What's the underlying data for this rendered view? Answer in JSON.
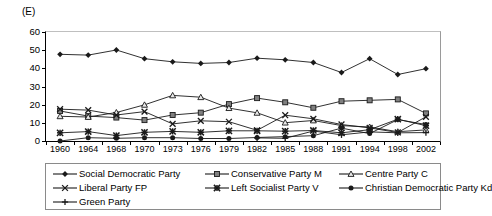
{
  "axis_unit_label": "(E)",
  "chart_data": {
    "type": "line",
    "title": "",
    "subtitle": "",
    "xlabel": "",
    "ylabel": "(E)",
    "ylim": [
      0,
      60
    ],
    "yticks": [
      0,
      10,
      20,
      30,
      40,
      50,
      60
    ],
    "grid": false,
    "legend_position": "bottom",
    "categories": [
      "1960",
      "1964",
      "1968",
      "1970",
      "1973",
      "1976",
      "1979",
      "1982",
      "1985",
      "1988",
      "1991",
      "1994",
      "1998",
      "2002"
    ],
    "series": [
      {
        "name": "Social Democratic Party",
        "marker": "diamond",
        "values": [
          47.7,
          47.3,
          50.1,
          45.3,
          43.6,
          42.7,
          43.2,
          45.6,
          44.7,
          43.2,
          37.7,
          45.3,
          36.6,
          39.8
        ]
      },
      {
        "name": "Conservative Party M",
        "marker": "square",
        "values": [
          16.5,
          13.7,
          12.9,
          11.5,
          14.3,
          15.6,
          20.3,
          23.6,
          21.3,
          18.3,
          21.9,
          22.4,
          22.9,
          15.2
        ]
      },
      {
        "name": "Centre Party C",
        "marker": "triangle",
        "values": [
          13.6,
          13.2,
          15.7,
          19.9,
          25.1,
          24.1,
          18.1,
          15.5,
          10.1,
          11.3,
          8.5,
          7.7,
          5.1,
          6.1
        ]
      },
      {
        "name": "Liberal Party FP",
        "marker": "cross-x",
        "values": [
          17.5,
          17.0,
          14.3,
          16.2,
          9.4,
          11.1,
          10.6,
          5.9,
          14.2,
          12.2,
          9.1,
          7.2,
          4.7,
          13.3
        ]
      },
      {
        "name": "Left Socialist Party V",
        "marker": "star",
        "values": [
          4.5,
          5.2,
          3.0,
          4.8,
          5.3,
          4.8,
          5.6,
          5.6,
          5.4,
          5.8,
          4.5,
          6.2,
          12.0,
          8.4
        ]
      },
      {
        "name": "Christian Democratic Party Kd",
        "marker": "circle",
        "values": [
          0.0,
          1.8,
          1.5,
          1.8,
          1.8,
          1.4,
          1.4,
          1.9,
          2.4,
          2.9,
          7.1,
          4.1,
          11.8,
          9.1
        ]
      },
      {
        "name": "Green Party",
        "marker": "plus",
        "values": [
          0.0,
          0.0,
          0.0,
          0.0,
          0.0,
          0.0,
          0.0,
          1.7,
          1.5,
          5.5,
          3.4,
          5.0,
          4.5,
          4.6
        ]
      }
    ]
  },
  "legend": {
    "entries": [
      {
        "label": "Social Democratic Party",
        "marker": "diamond"
      },
      {
        "label": "Conservative Party M",
        "marker": "square"
      },
      {
        "label": "Centre Party C",
        "marker": "triangle"
      },
      {
        "label": "Liberal Party FP",
        "marker": "cross-x"
      },
      {
        "label": "Left Socialist Party V",
        "marker": "star"
      },
      {
        "label": "Christian Democratic Party Kd",
        "marker": "circle"
      },
      {
        "label": "Green Party",
        "marker": "plus"
      }
    ]
  },
  "colors": {
    "line": "#1a1a1a",
    "marker_fill_dark": "#1a1a1a",
    "marker_fill_grey": "#808080",
    "frame": "#000000",
    "legend_border": "#8a8a8a",
    "background": "#ffffff"
  }
}
